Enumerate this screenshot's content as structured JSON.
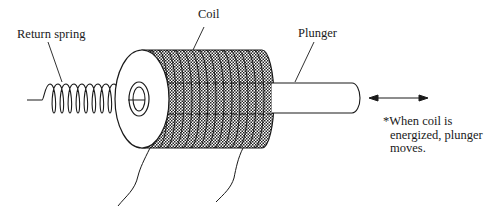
{
  "diagram": {
    "type": "solenoid-schematic",
    "labels": {
      "return_spring": "Return spring",
      "coil": "Coil",
      "plunger": "Plunger"
    },
    "note": {
      "lines": [
        "*When coil is",
        "energized, plunger",
        "moves."
      ]
    },
    "colors": {
      "ink": "#1a1a1a",
      "coil_fill": "#3a3a3a",
      "background": "#ffffff"
    }
  }
}
